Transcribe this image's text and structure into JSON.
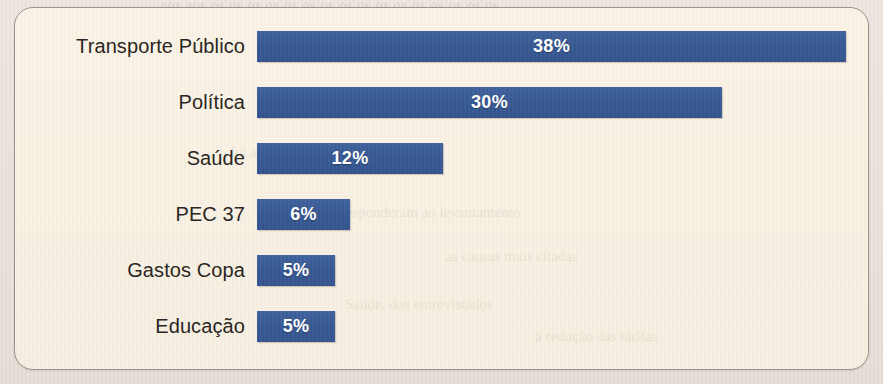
{
  "chart_data": {
    "type": "bar",
    "orientation": "horizontal",
    "title": "",
    "xlabel": "",
    "ylabel": "",
    "grid": false,
    "legend": null,
    "value_suffix": "%",
    "xlim": [
      0,
      38
    ],
    "categories": [
      "Transporte Público",
      "Política",
      "Saúde",
      "PEC 37",
      "Gastos Copa",
      "Educação"
    ],
    "values": [
      38,
      30,
      12,
      6,
      5,
      5
    ],
    "value_labels": [
      "38%",
      "30%",
      "12%",
      "6%",
      "5%",
      "5%"
    ],
    "bars": [
      {
        "category": "Transporte Público",
        "value": 38,
        "label": "38%"
      },
      {
        "category": "Política",
        "value": 30,
        "label": "30%"
      },
      {
        "category": "Saúde",
        "value": 12,
        "label": "12%"
      },
      {
        "category": "PEC 37",
        "value": 6,
        "label": "6%"
      },
      {
        "category": "Gastos Copa",
        "value": 5,
        "label": "5%"
      },
      {
        "category": "Educação",
        "value": 5,
        "label": "5%"
      }
    ],
    "colors": {
      "bar": "#385a96",
      "bar_label": "#ffffff",
      "category_label": "#2b2622",
      "panel_background": "#f7efe0",
      "panel_border": "#9a938c",
      "page_background": "#e9e1da"
    }
  },
  "background_text": {
    "top_line": "aos aos os os os os os os os os os os os os os os os os",
    "inner_lines": [
      "foi a mais citada pelos",
      "que responderam ao levantamento",
      "as causas mais citadas",
      "Saúde, dos entrevistados",
      "a redução das tarifas"
    ]
  }
}
